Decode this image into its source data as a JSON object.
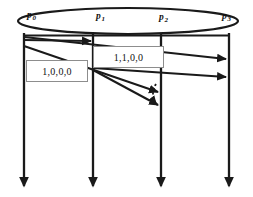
{
  "diagram": {
    "canvas": {
      "width": 253,
      "height": 197,
      "background": "#ffffff"
    },
    "ink_color": "#1a1a1a",
    "box_border_color": "#8d8d8d",
    "processes": [
      {
        "id": "p0",
        "name": "p",
        "subscript": "0",
        "x": 24,
        "label_x": 27,
        "label_y": 16
      },
      {
        "id": "p1",
        "name": "p",
        "subscript": "1",
        "x": 93,
        "label_x": 96,
        "label_y": 17
      },
      {
        "id": "p2",
        "name": "p",
        "subscript": "2",
        "x": 161,
        "label_x": 160,
        "label_y": 18
      },
      {
        "id": "p3",
        "name": "p",
        "subscript": "3",
        "x": 229,
        "label_x": 222,
        "label_y": 17
      }
    ],
    "ellipse": {
      "cx": 128,
      "cy": 21,
      "rx": 110,
      "ry": 13
    },
    "timelines": {
      "top_y": 33,
      "bottom_y": 190
    },
    "vector_timestamps": [
      {
        "id": "vt-p0",
        "value": "1,0,0,0",
        "x": 26,
        "y": 60,
        "width": 62,
        "height": 22
      },
      {
        "id": "vt-p1",
        "value": "1,1,0,0",
        "x": 93,
        "y": 46,
        "width": 71,
        "height": 22
      }
    ],
    "messages": [
      {
        "id": "m0",
        "from": "p0",
        "to": "p1",
        "x1": 24,
        "y1": 40,
        "x2": 93,
        "y2": 41,
        "style": "solid"
      },
      {
        "id": "m1",
        "from": "p0",
        "to": "p3",
        "x1": 24,
        "y1": 36,
        "x2": 229,
        "y2": 59,
        "style": "solid"
      },
      {
        "id": "m2",
        "from": "p1",
        "to": "p3",
        "x1": 93,
        "y1": 68,
        "x2": 229,
        "y2": 77,
        "style": "solid"
      },
      {
        "id": "m3",
        "from": "p0",
        "to": "p2",
        "x1": 24,
        "y1": 46,
        "x2": 161,
        "y2": 93,
        "style": "solid"
      },
      {
        "id": "m4",
        "from": "p1",
        "to": "p2",
        "x1": 93,
        "y1": 70,
        "x2": 161,
        "y2": 106,
        "style": "solid"
      },
      {
        "id": "m5",
        "from": "p2",
        "to": "p2",
        "x1": 159,
        "y1": 92,
        "x2": 159,
        "y2": 106,
        "style": "dashed"
      }
    ]
  }
}
